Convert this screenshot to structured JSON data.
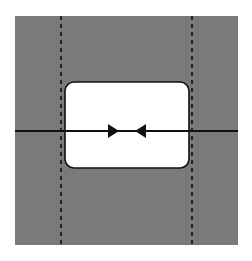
{
  "diagram": {
    "canvas": {
      "width": 252,
      "height": 261,
      "background": "#ffffff"
    },
    "background_square": {
      "x": 15,
      "y": 16,
      "width": 223,
      "height": 229,
      "fill": "#7a7a7a"
    },
    "guide_lines": [
      {
        "name": "left-dashed-guide",
        "x": 61,
        "y1": 16,
        "y2": 245,
        "stroke": "#111111",
        "dash": "4,4"
      },
      {
        "name": "right-dashed-guide",
        "x": 192,
        "y1": 16,
        "y2": 245,
        "stroke": "#111111",
        "dash": "4,4"
      }
    ],
    "frame": {
      "x": 65,
      "y": 82,
      "width": 124,
      "height": 86,
      "rx": 9,
      "fill": "#ffffff",
      "stroke": "#111111"
    },
    "axis_line": {
      "y": 131,
      "x1": 15,
      "x2": 238,
      "stroke": "#111111"
    },
    "arrows": [
      {
        "name": "arrow-right",
        "direction": "right",
        "tip_x": 119,
        "base_x": 108,
        "y": 131,
        "half_height": 7
      },
      {
        "name": "arrow-left",
        "direction": "left",
        "tip_x": 135,
        "base_x": 146,
        "y": 131,
        "half_height": 7
      }
    ]
  }
}
